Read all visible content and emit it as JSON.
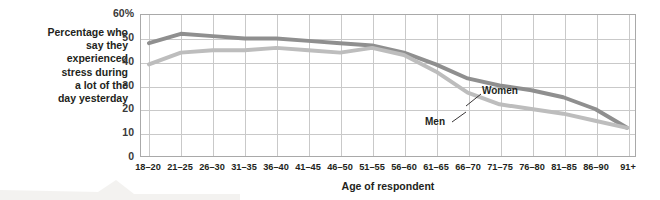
{
  "chart_data": {
    "type": "line",
    "title": "",
    "xlabel": "Age of respondent",
    "ylabel": "Percentage who say they experienced stress during a lot of the day yesterday",
    "ylabel_lines": [
      "Percentage who",
      "say they",
      "experienced",
      "stress during",
      "a lot of the",
      "day yesterday"
    ],
    "categories": [
      "18–20",
      "21–25",
      "26–30",
      "31–35",
      "36–40",
      "41–45",
      "46–50",
      "51–55",
      "56–60",
      "61–65",
      "66–70",
      "71–75",
      "76–80",
      "81–85",
      "86–90",
      "91+"
    ],
    "ylim": [
      0,
      60
    ],
    "yticks": [
      0,
      10,
      20,
      30,
      40,
      50,
      60
    ],
    "ytick_labels": [
      "0",
      "10",
      "20",
      "30",
      "40",
      "50",
      "60%"
    ],
    "grid": true,
    "legend": "inline-annotations",
    "series": [
      {
        "name": "Women",
        "color": "#8f8f8f",
        "values": [
          48,
          52,
          51,
          50,
          50,
          49,
          48,
          47,
          44,
          39,
          33,
          30,
          28,
          25,
          20,
          12
        ]
      },
      {
        "name": "Men",
        "color": "#bdbdbd",
        "values": [
          39,
          44,
          45,
          45,
          46,
          45,
          44,
          46,
          43,
          36,
          27,
          22,
          20,
          18,
          15,
          12
        ]
      }
    ],
    "annotations": [
      {
        "id": "ann-women",
        "text": "Women",
        "series": "Women"
      },
      {
        "id": "ann-men",
        "text": "Men",
        "series": "Men"
      }
    ]
  },
  "axis": {
    "x_title": "Age of respondent"
  },
  "colors": {
    "women_line": "#8f8f8f",
    "men_line": "#bdbdbd",
    "grid": "#c9c9c9",
    "frame": "#a9a9a9",
    "text": "#231f20"
  }
}
